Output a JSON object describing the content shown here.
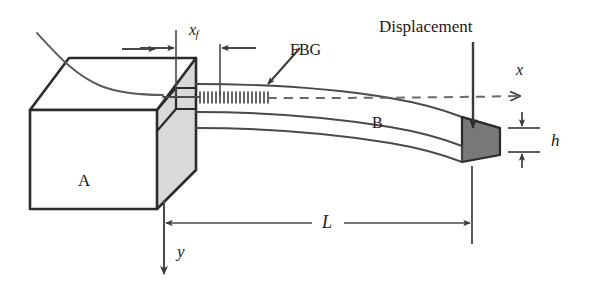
{
  "figure": {
    "background_color": "#ffffff",
    "line_color": "#2b2b2b",
    "thin_line_color": "#4a4a4a",
    "block_face_fill": "#d9d9d9",
    "beam_end_fill": "#787878",
    "width": 593,
    "height": 293
  },
  "labels": {
    "displacement": "Displacement",
    "fbg": "FBG",
    "block_a": "A",
    "beam_b": "B",
    "length_L": "L",
    "thickness_h": "h",
    "axis_x": "x",
    "axis_y": "y",
    "fiber_pos_x": "x",
    "fiber_pos_sub": "f"
  },
  "annotations": {
    "dimension_L_desc": "Cantilever free length from clamp face to beam tip",
    "dimension_xf_desc": "Distance from clamp to the start of the FBG grating",
    "dimension_h_desc": "Beam thickness at free end",
    "axis_x_desc": "Horizontal neutral axis, dashed, arrow to the right",
    "axis_y_desc": "Vertical downward axis from clamp base",
    "displacement_desc": "Downward applied displacement arrow at beam tip"
  }
}
